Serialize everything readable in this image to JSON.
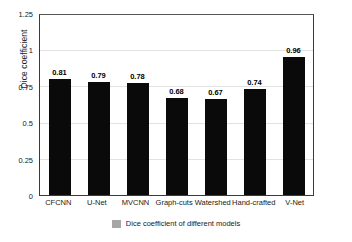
{
  "chart_data": {
    "type": "bar",
    "title": "",
    "subtitle": "",
    "xlabel": "",
    "ylabel": "Dice coefficient",
    "ylim": [
      0,
      1.25
    ],
    "yticks": [
      "0",
      "0.25",
      "0.5",
      "0.75",
      "1",
      "1.25"
    ],
    "ytick_values": [
      0,
      0.25,
      0.5,
      0.75,
      1,
      1.25
    ],
    "grid": "horizontal",
    "legend_position": "bottom",
    "legend": [
      "Dice coefficient of different models"
    ],
    "categories": [
      "CFCNN",
      "U-Net",
      "MVCNN",
      "Graph-cuts",
      "Watershed",
      "Hand-crafted",
      "V-Net"
    ],
    "values": [
      0.81,
      0.79,
      0.78,
      0.68,
      0.67,
      0.74,
      0.96
    ],
    "data_labels": [
      "0.81",
      "0.79",
      "0.78",
      "0.68",
      "0.67",
      "0.74",
      "0.96"
    ],
    "bar_color": "#0a0a0a",
    "gridline_color": "#e2e2e2",
    "axis_color": "#3a3a3a",
    "legend_swatch_color": "#a6a6a6",
    "background_color": "#ffffff"
  },
  "legend": {
    "swatch_name": "legend-swatch",
    "label": "Dice coefficient of different models"
  }
}
